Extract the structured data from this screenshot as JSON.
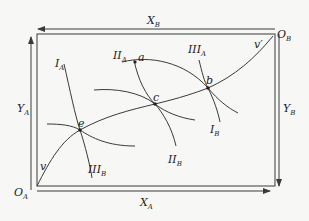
{
  "diagram": {
    "type": "edgeworth-box",
    "colors": {
      "line": "#3a3a3a",
      "background": "#f7f7f5",
      "text": "#222222"
    },
    "origins": {
      "A": {
        "label": "O",
        "sub": "A"
      },
      "B": {
        "label": "O",
        "sub": "B"
      }
    },
    "axes": {
      "XA": {
        "label": "X",
        "sub": "A"
      },
      "YA": {
        "label": "Y",
        "sub": "A"
      },
      "XB": {
        "label": "X",
        "sub": "B"
      },
      "YB": {
        "label": "Y",
        "sub": "B"
      }
    },
    "indifference_curves": {
      "IA": {
        "label": "I",
        "sub": "A"
      },
      "IIA": {
        "label": "II",
        "sub": "A"
      },
      "IIIA": {
        "label": "III",
        "sub": "A"
      },
      "IB": {
        "label": "I",
        "sub": "B"
      },
      "IIB": {
        "label": "II",
        "sub": "B"
      },
      "IIIB": {
        "label": "III",
        "sub": "B"
      }
    },
    "points": {
      "a": "a",
      "b": "b",
      "c": "c",
      "e": "e"
    },
    "curve_ends": {
      "v": "v",
      "v_prime": "v′"
    }
  }
}
